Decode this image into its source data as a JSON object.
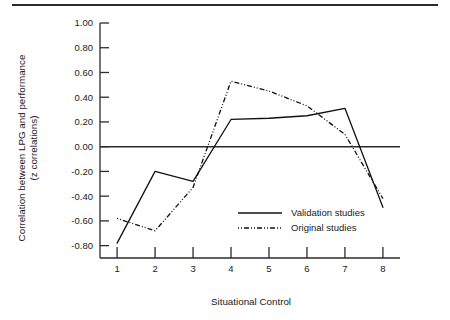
{
  "figure": {
    "background_color": "#ffffff",
    "ink_color": "#111111",
    "has_top_rule": true
  },
  "chart_data": {
    "type": "line",
    "title": "",
    "xlabel": "Situational Control",
    "ylabel": "Correlation between LPG and performance (z correlations)",
    "ylabel_line1": "Correlation between LPG and performance",
    "ylabel_line2": "(z correlations)",
    "x": [
      1,
      2,
      3,
      4,
      5,
      6,
      7,
      8
    ],
    "categories": [
      "1",
      "2",
      "3",
      "4",
      "5",
      "6",
      "7",
      "8"
    ],
    "xtick_labels": [
      "1",
      "2",
      "3",
      "4",
      "5",
      "6",
      "7",
      "8"
    ],
    "ytick_labels": [
      "1.00",
      "0.80",
      "0.60",
      "0.40",
      "0.20",
      "0.00",
      "-0.20",
      "-0.40",
      "-0.60",
      "-0.80"
    ],
    "ytick_values": [
      1.0,
      0.8,
      0.6,
      0.4,
      0.2,
      0.0,
      -0.2,
      -0.4,
      -0.6,
      -0.8
    ],
    "ylim": [
      -0.9,
      1.0
    ],
    "xlim": [
      0.55,
      8.45
    ],
    "grid": false,
    "zero_line": true,
    "legend_position": "center-right-lower",
    "series": [
      {
        "name": "Validation studies",
        "style": "solid",
        "color": "#111111",
        "values": [
          -0.78,
          -0.2,
          -0.28,
          0.22,
          0.23,
          0.25,
          0.31,
          -0.49
        ]
      },
      {
        "name": "Original studies",
        "style": "dash-dot",
        "color": "#111111",
        "values": [
          -0.58,
          -0.68,
          -0.33,
          0.53,
          0.45,
          0.33,
          0.1,
          -0.42
        ]
      }
    ]
  },
  "legend": {
    "items": [
      {
        "label": "Validation studies",
        "style": "solid"
      },
      {
        "label": "Original studies",
        "style": "dash-dot"
      }
    ]
  }
}
